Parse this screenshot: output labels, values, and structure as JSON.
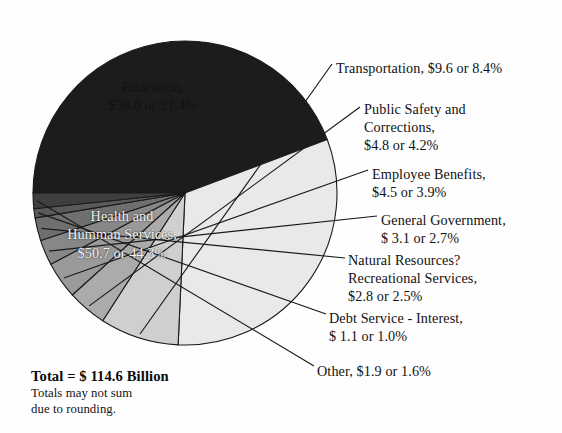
{
  "chart_data": {
    "type": "pie",
    "title": "",
    "units": "billions of dollars",
    "total_label": "Total = $ 114.6 Billion",
    "total_value": 114.6,
    "note_lines": [
      "Totals may not sum",
      "due to rounding."
    ],
    "legend_position": "callout-labels-right",
    "grid": false,
    "categories": [
      "Health and Humman Services",
      "Education",
      "Transportation",
      "Public Safety and Corrections",
      "Employee Benefits",
      "General Government",
      "Natural Resources? Recreational Services",
      "Debt Service - Interest",
      "Other"
    ],
    "values": [
      50.7,
      36.0,
      9.6,
      4.8,
      4.5,
      3.1,
      2.8,
      1.1,
      1.9
    ],
    "percents": [
      44.3,
      31.4,
      8.4,
      4.2,
      3.9,
      2.7,
      2.5,
      1.0,
      1.6
    ],
    "colors": [
      "#1c1c1c",
      "#e9e9e9",
      "#cfcfcf",
      "#ababab",
      "#9a9a9a",
      "#878787",
      "#6f6f6f",
      "#5a5a5a",
      "#3f3f3f"
    ],
    "slices": [
      {
        "name": "Health and Humman Services",
        "value": 50.7,
        "percent": 44.3,
        "color": "#1c1c1c",
        "label_mode": "inside-dark",
        "label_lines": [
          "Health and",
          "Humman Services,",
          "$50.7 or 44.3%"
        ]
      },
      {
        "name": "Education",
        "value": 36.0,
        "percent": 31.4,
        "color": "#e9e9e9",
        "label_mode": "inside-light",
        "label_lines": [
          "Education,",
          "$36.0 or 31.4%"
        ]
      },
      {
        "name": "Transportation",
        "value": 9.6,
        "percent": 8.4,
        "color": "#cfcfcf",
        "label_mode": "callout",
        "label_lines": [
          "Transportation, $9.6 or 8.4%"
        ]
      },
      {
        "name": "Public Safety and Corrections",
        "value": 4.8,
        "percent": 4.2,
        "color": "#ababab",
        "label_mode": "callout",
        "label_lines": [
          "Public Safety and",
          "Corrections,",
          "$4.8 or 4.2%"
        ]
      },
      {
        "name": "Employee Benefits",
        "value": 4.5,
        "percent": 3.9,
        "color": "#9a9a9a",
        "label_mode": "callout",
        "label_lines": [
          "Employee Benefits,",
          "$4.5 or 3.9%"
        ]
      },
      {
        "name": "General Government",
        "value": 3.1,
        "percent": 2.7,
        "color": "#878787",
        "label_mode": "callout",
        "label_lines": [
          "General Government,",
          "$ 3.1 or 2.7%"
        ]
      },
      {
        "name": "Natural Resources? Recreational Services",
        "value": 2.8,
        "percent": 2.5,
        "color": "#6f6f6f",
        "label_mode": "callout",
        "label_lines": [
          "Natural Resources?",
          "Recreational Services,",
          "$2.8 or 2.5%"
        ]
      },
      {
        "name": "Debt Service - Interest",
        "value": 1.1,
        "percent": 1.0,
        "color": "#5a5a5a",
        "label_mode": "callout",
        "label_lines": [
          "Debt Service - Interest,",
          "$ 1.1 or 1.0%"
        ]
      },
      {
        "name": "Other",
        "value": 1.9,
        "percent": 1.6,
        "color": "#3f3f3f",
        "label_mode": "callout",
        "label_lines": [
          "Other, $1.9 or 1.6%"
        ]
      }
    ],
    "geometry": {
      "center_x": 185,
      "center_y": 193,
      "radius": 152,
      "start_angle_deg": 180,
      "direction": "clockwise"
    }
  }
}
